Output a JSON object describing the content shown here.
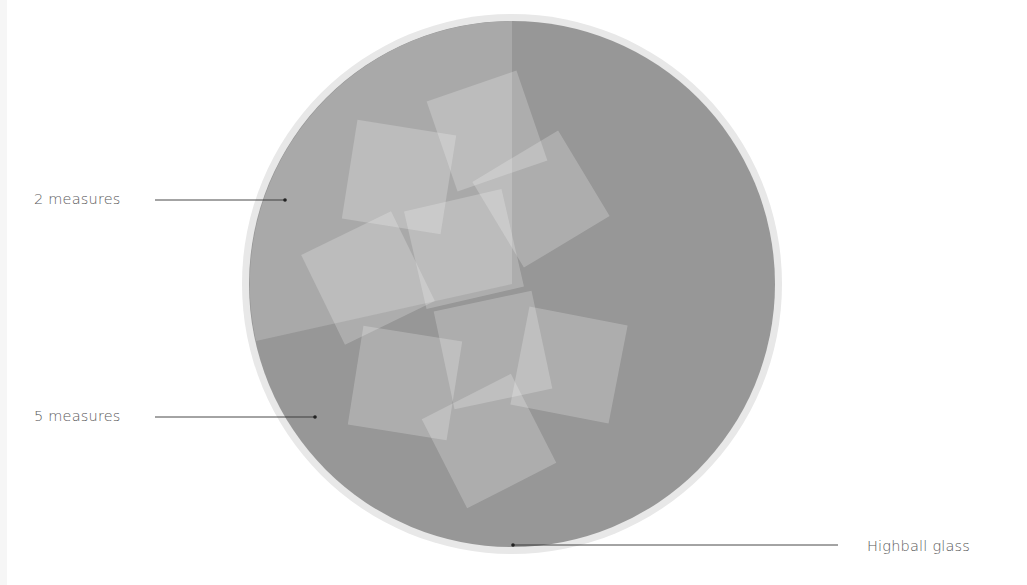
{
  "diagram": {
    "labels": {
      "two_measures": "2 measures",
      "five_measures": "5 measures",
      "glass": "Highball glass"
    },
    "colors": {
      "background": "#ffffff",
      "glass_rim": "#e8e8e8",
      "liquid_main": "#979797",
      "liquid_secondary": "#a9a9a9",
      "ice": "#c8c8c8",
      "leader_line": "#333333",
      "label_text": "#5a5a5a"
    },
    "glass": {
      "cx": 512,
      "cy": 284,
      "r_outer": 270,
      "r_inner": 263
    },
    "sector_two_measures": {
      "start_point": [
        256,
        340
      ],
      "end_point": [
        512,
        21
      ]
    },
    "ice_cubes": [
      {
        "cx": 487,
        "cy": 131,
        "size": 95,
        "rotate": -19
      },
      {
        "cx": 399,
        "cy": 177,
        "size": 100,
        "rotate": 9
      },
      {
        "cx": 541,
        "cy": 199,
        "size": 100,
        "rotate": -31
      },
      {
        "cx": 464,
        "cy": 249,
        "size": 100,
        "rotate": -13
      },
      {
        "cx": 368,
        "cy": 278,
        "size": 100,
        "rotate": -26
      },
      {
        "cx": 405,
        "cy": 383,
        "size": 100,
        "rotate": 9
      },
      {
        "cx": 493,
        "cy": 350,
        "size": 100,
        "rotate": -12
      },
      {
        "cx": 569,
        "cy": 365,
        "size": 100,
        "rotate": 11
      },
      {
        "cx": 489,
        "cy": 441,
        "size": 100,
        "rotate": -27
      }
    ],
    "leaders": [
      {
        "label": "2 measures",
        "x1": 155,
        "y1": 200,
        "x2": 285,
        "y2": 200
      },
      {
        "label": "5 measures",
        "x1": 155,
        "y1": 417,
        "x2": 315,
        "y2": 417
      },
      {
        "label": "Highball glass",
        "x1": 513,
        "y1": 545,
        "x2": 838,
        "y2": 545
      }
    ]
  }
}
